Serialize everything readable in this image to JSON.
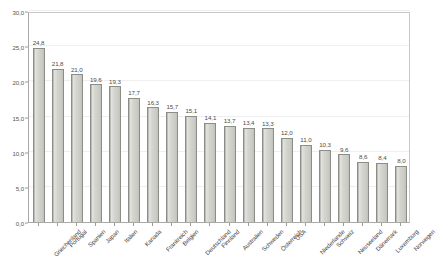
{
  "chart_data": {
    "type": "bar",
    "title": "",
    "xlabel": "",
    "ylabel": "",
    "ylim": [
      0,
      30
    ],
    "ytick_labels": [
      "0,0",
      "5,0",
      "10,0",
      "15,0",
      "20,0",
      "25,0",
      "30,0"
    ],
    "ytick_values": [
      0,
      5,
      10,
      15,
      20,
      25,
      30
    ],
    "grid": true,
    "legend": false,
    "decimal_separator": ",",
    "categories": [
      "Griechenland",
      "Portugal",
      "Spanien",
      "Japan",
      "Italien",
      "Kanada",
      "Frankreich",
      "Belgien",
      "Deutschland",
      "Finnland",
      "Australien",
      "Schweden",
      "Österreich",
      "USA",
      "Niederlande",
      "Schweiz",
      "Neuseeland",
      "Dänemark",
      "Luxemburg",
      "Norwegen"
    ],
    "values": [
      24.8,
      21.8,
      21.0,
      19.6,
      19.3,
      17.7,
      16.3,
      15.7,
      15.1,
      14.1,
      13.7,
      13.4,
      13.3,
      12.0,
      11.0,
      10.3,
      9.6,
      8.6,
      8.4,
      8.0
    ],
    "value_labels": [
      "24,8",
      "21,8",
      "21,0",
      "19,6",
      "19,3",
      "17,7",
      "16,3",
      "15,7",
      "15,1",
      "14,1",
      "13,7",
      "13,4",
      "13,3",
      "12,0",
      "11,0",
      "10,3",
      "9,6",
      "8,6",
      "8,4",
      "8,0"
    ],
    "colors": {
      "bar_fill": "#d4d4cf",
      "bar_edge": "#8d8d88",
      "gridline": "#efefef",
      "axis": "#a8a8a8",
      "text": "#4a4845",
      "background": "#ffffff"
    }
  }
}
